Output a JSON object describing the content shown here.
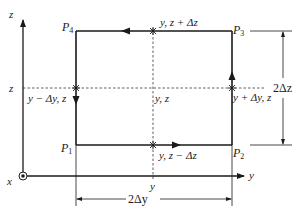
{
  "diagram": {
    "type": "geometric-flux-loop",
    "axes": {
      "z_label": "z",
      "y_label": "y",
      "x_label": "x",
      "x_symbol": "out-of-page (dot in circle)"
    },
    "corners": {
      "p1": {
        "base": "P",
        "sub": "1"
      },
      "p2": {
        "base": "P",
        "sub": "2"
      },
      "p3": {
        "base": "P",
        "sub": "3"
      },
      "p4": {
        "base": "P",
        "sub": "4"
      }
    },
    "midpoints": {
      "top": "y, z + Δz",
      "bottom": "y, z − Δz",
      "left": "y − Δy, z",
      "right": "y + Δy, z",
      "center": "y, z"
    },
    "axis_ticks": {
      "z_tick": "z",
      "y_tick": "y"
    },
    "dimensions": {
      "height": "2Δz",
      "width": "2Δy"
    },
    "circulation": "counter-clockwise: P1 → P2 → P3 → P4 → P1",
    "colors": {
      "stroke": "#1a1a1a",
      "background": "#ffffff"
    }
  }
}
